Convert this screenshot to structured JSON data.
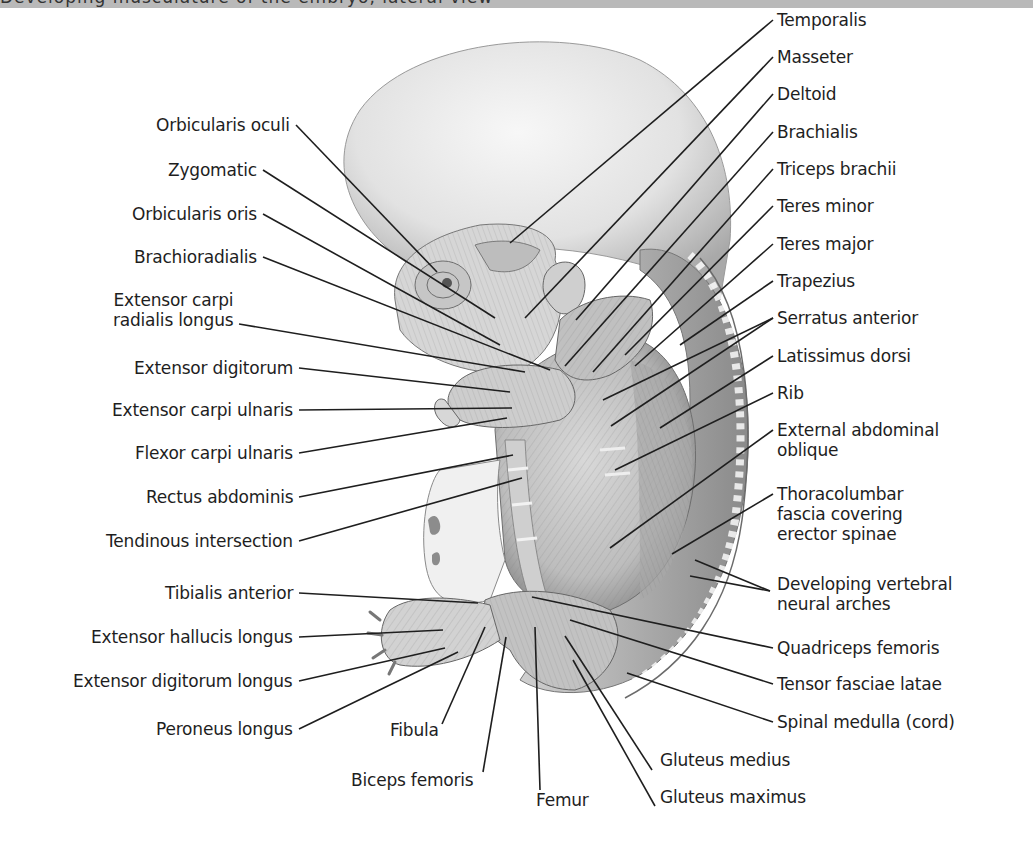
{
  "header": {
    "title_fragment": "Developing musculature of the embryo, lateral view"
  },
  "figure": {
    "colors": {
      "ink": "#1e1e1e",
      "skin_light": "#ececec",
      "skin_mid": "#c4c4c4",
      "skin_dark": "#8e8e8e",
      "header_bar": "#b9b9b9"
    }
  },
  "labels": {
    "left": [
      {
        "text": "Orbicularis oculi",
        "x": 290,
        "y": 125,
        "tx": 437,
        "ty": 272
      },
      {
        "text": "Zygomatic",
        "x": 257,
        "y": 170,
        "tx": 495,
        "ty": 318
      },
      {
        "text": "Orbicularis oris",
        "x": 257,
        "y": 214,
        "tx": 500,
        "ty": 345
      },
      {
        "text": "Brachioradialis",
        "x": 257,
        "y": 257,
        "tx": 550,
        "ty": 370
      },
      {
        "text": "Extensor carpi\nradialis longus",
        "x": 233,
        "y": 300,
        "tx": 525,
        "ty": 372,
        "ly": 324
      },
      {
        "text": "Extensor digitorum",
        "x": 293,
        "y": 368,
        "tx": 510,
        "ty": 392
      },
      {
        "text": "Extensor carpi ulnaris",
        "x": 293,
        "y": 410,
        "tx": 512,
        "ty": 408
      },
      {
        "text": "Flexor carpi ulnaris",
        "x": 293,
        "y": 453,
        "tx": 507,
        "ty": 418
      },
      {
        "text": "Rectus abdominis",
        "x": 293,
        "y": 497,
        "tx": 513,
        "ty": 455
      },
      {
        "text": "Tendinous intersection",
        "x": 293,
        "y": 541,
        "tx": 522,
        "ty": 478
      },
      {
        "text": "Tibialis anterior",
        "x": 293,
        "y": 593,
        "tx": 478,
        "ty": 603
      },
      {
        "text": "Extensor hallucis longus",
        "x": 293,
        "y": 637,
        "tx": 443,
        "ty": 630
      },
      {
        "text": "Extensor digitorum longus",
        "x": 293,
        "y": 681,
        "tx": 445,
        "ty": 648
      },
      {
        "text": "Peroneus longus",
        "x": 293,
        "y": 729,
        "tx": 458,
        "ty": 652
      }
    ],
    "bottom": [
      {
        "text": "Fibula",
        "x": 390,
        "y": 730,
        "tx": 485,
        "ty": 627,
        "lx": 442,
        "ly": 724
      },
      {
        "text": "Biceps femoris",
        "x": 351,
        "y": 780,
        "tx": 506,
        "ty": 637,
        "lx": 483,
        "ly": 772
      },
      {
        "text": "Femur",
        "x": 536,
        "y": 800,
        "tx": 535,
        "ty": 627,
        "lx": 540,
        "ly": 790
      },
      {
        "text": "Gluteus medius",
        "x": 660,
        "y": 760,
        "tx": 565,
        "ty": 636,
        "lx": 652,
        "ly": 770
      },
      {
        "text": "Gluteus maximus",
        "x": 660,
        "y": 797,
        "tx": 573,
        "ty": 660,
        "lx": 655,
        "ly": 806
      }
    ],
    "right": [
      {
        "text": "Temporalis",
        "x": 777,
        "y": 20,
        "tx": 510,
        "ty": 243
      },
      {
        "text": "Masseter",
        "x": 777,
        "y": 57,
        "tx": 525,
        "ty": 318
      },
      {
        "text": "Deltoid",
        "x": 777,
        "y": 94,
        "tx": 576,
        "ty": 320
      },
      {
        "text": "Brachialis",
        "x": 777,
        "y": 132,
        "tx": 565,
        "ty": 366
      },
      {
        "text": "Triceps brachii",
        "x": 777,
        "y": 169,
        "tx": 593,
        "ty": 372
      },
      {
        "text": "Teres minor",
        "x": 777,
        "y": 206,
        "tx": 625,
        "ty": 355
      },
      {
        "text": "Teres major",
        "x": 777,
        "y": 244,
        "tx": 635,
        "ty": 366
      },
      {
        "text": "Trapezius",
        "x": 777,
        "y": 281,
        "tx": 680,
        "ty": 345
      },
      {
        "text": "Serratus anterior",
        "x": 777,
        "y": 318,
        "tx": 603,
        "ty": 400,
        "tx2": 611,
        "ty2": 426
      },
      {
        "text": "Latissimus dorsi",
        "x": 777,
        "y": 356,
        "tx": 660,
        "ty": 428
      },
      {
        "text": "Rib",
        "x": 777,
        "y": 393,
        "tx": 615,
        "ty": 470
      },
      {
        "text": "External abdominal\noblique",
        "x": 777,
        "y": 430,
        "tx": 610,
        "ty": 548
      },
      {
        "text": "Thoracolumbar\nfascia covering\nerector spinae",
        "x": 777,
        "y": 494,
        "tx": 672,
        "ty": 554
      },
      {
        "text": "Developing vertebral\nneural arches",
        "x": 777,
        "y": 584,
        "tx": 695,
        "ty": 560,
        "tx2": 690,
        "ty2": 576,
        "lx": 770,
        "ly": 591
      },
      {
        "text": "Quadriceps femoris",
        "x": 777,
        "y": 648,
        "tx": 532,
        "ty": 597
      },
      {
        "text": "Tensor fasciae latae",
        "x": 777,
        "y": 684,
        "tx": 570,
        "ty": 620
      },
      {
        "text": "Spinal medulla (cord)",
        "x": 777,
        "y": 722,
        "tx": 627,
        "ty": 673
      }
    ]
  }
}
